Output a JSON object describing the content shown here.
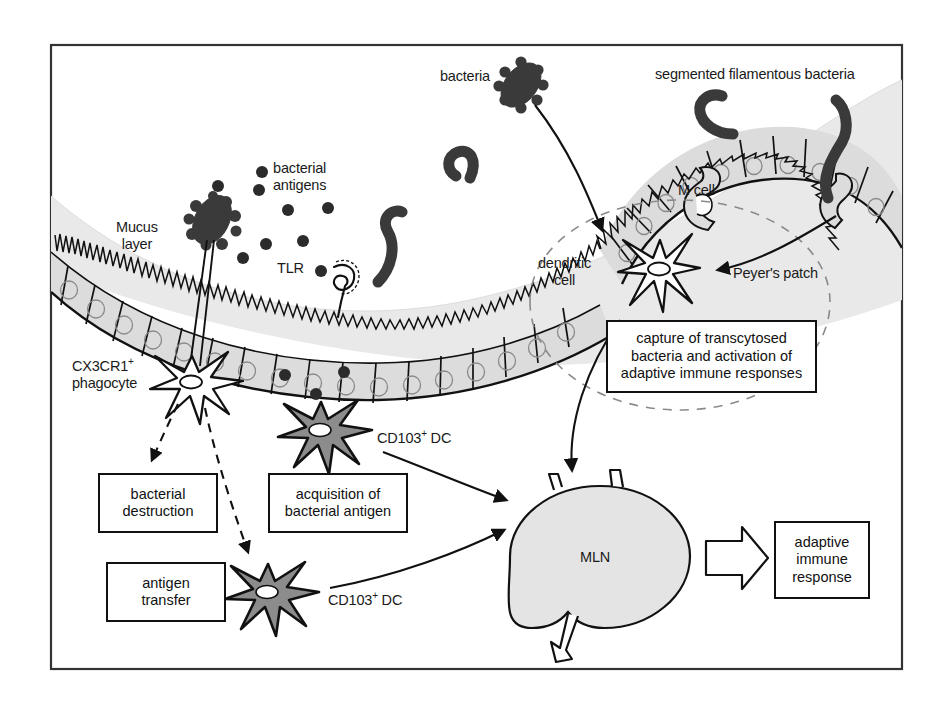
{
  "figure": {
    "frame": {
      "x": 50,
      "y": 44,
      "width": 853,
      "height": 626,
      "border_color": "#333333"
    },
    "background_color": "#ffffff",
    "mucus_color": "#e9e9e9",
    "epithelium_fill": "#dcdcdc",
    "dc_fill": "#8c8c8c",
    "mln_fill": "#e4e4e4",
    "bacteria_color": "#3a3a3a",
    "line_color": "#111111"
  },
  "labels": {
    "bacteria": "bacteria",
    "segmented_filamentous_bacteria": "segmented filamentous bacteria",
    "bacterial_antigens": "bacterial\nantigens",
    "mucus_layer": "Mucus\nlayer",
    "tlr": "TLR",
    "m_cell": "M cell",
    "dendritic_cell": "dendritic\ncell",
    "peyers_patch": "Peyer's patch",
    "cx3cr1_phagocyte_main": "CX3CR1",
    "cx3cr1_phagocyte_sup": "+",
    "cx3cr1_phagocyte_line2": "phagocyte",
    "cd103_dc_upper_main": "CD103",
    "cd103_dc_upper_sup": "+",
    "cd103_dc_upper_tail": " DC",
    "cd103_dc_lower_main": "CD103",
    "cd103_dc_lower_sup": "+",
    "cd103_dc_lower_tail": " DC",
    "mln": "MLN"
  },
  "boxes": [
    {
      "id": "bacterial-destruction",
      "text": "bacterial\ndestruction",
      "x": 98,
      "y": 473,
      "width": 120,
      "height": 60
    },
    {
      "id": "acquisition-of-bacterial-antigen",
      "text": "acquisition of\nbacterial antigen",
      "x": 268,
      "y": 473,
      "width": 140,
      "height": 60
    },
    {
      "id": "antigen-transfer",
      "text": "antigen\ntransfer",
      "x": 106,
      "y": 562,
      "width": 120,
      "height": 60
    },
    {
      "id": "capture-transcytosed",
      "text": "capture of transcytosed\nbacteria and activation of\nadaptive immune responses",
      "x": 606,
      "y": 320,
      "width": 211,
      "height": 73
    },
    {
      "id": "adaptive-immune-response",
      "text": "adaptive\nimmune\nresponse",
      "x": 774,
      "y": 521,
      "width": 96,
      "height": 78
    }
  ],
  "cells": {
    "dendritic_cell_peyer": {
      "cx": 660,
      "cy": 266,
      "label": "dendritic cell"
    },
    "cx3cr1_phagocyte": {
      "cx": 192,
      "cy": 382,
      "label": "CX3CR1+ phagocyte"
    },
    "cd103_dc_upper": {
      "cx": 321,
      "cy": 430,
      "label": "CD103+ DC"
    },
    "cd103_dc_lower": {
      "cx": 268,
      "cy": 592,
      "label": "CD103+ DC"
    },
    "mln": {
      "cx": 600,
      "cy": 558,
      "rx": 88,
      "ry": 72,
      "label": "MLN"
    }
  },
  "antigen_dots": [
    {
      "x": 262,
      "y": 172
    },
    {
      "x": 218,
      "y": 186
    },
    {
      "x": 259,
      "y": 190
    },
    {
      "x": 288,
      "y": 210
    },
    {
      "x": 328,
      "y": 208
    },
    {
      "x": 266,
      "y": 244
    },
    {
      "x": 303,
      "y": 241
    },
    {
      "x": 243,
      "y": 258
    },
    {
      "x": 321,
      "y": 271
    },
    {
      "x": 285,
      "y": 375
    },
    {
      "x": 316,
      "y": 394
    },
    {
      "x": 344,
      "y": 372
    }
  ]
}
